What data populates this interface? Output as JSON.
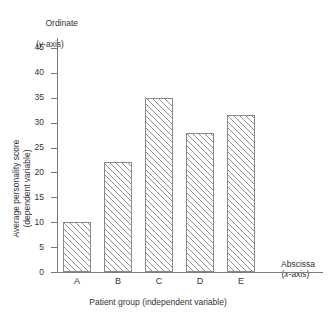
{
  "chart_data": {
    "type": "bar",
    "title": "",
    "categories": [
      "A",
      "B",
      "C",
      "D",
      "E"
    ],
    "values": [
      10,
      22,
      35,
      28,
      31.5
    ],
    "series": [
      {
        "name": "Average personality score",
        "values": [
          10,
          22,
          35,
          28,
          31.5
        ]
      }
    ],
    "xlabel": "Patient group (independent variable)",
    "ylabel": "Average personality score (dependent variable)",
    "ylim": [
      0,
      47
    ],
    "yticks": [
      0,
      5,
      10,
      15,
      20,
      25,
      30,
      35,
      40,
      45
    ],
    "ytick_labels": [
      "0",
      "5",
      "10",
      "15",
      "20",
      "25",
      "30",
      "35",
      "40",
      "45"
    ],
    "grid": false,
    "legend": false,
    "annotations": {
      "ordinate_line1": "Ordinate",
      "ordinate_line2_prefix": "(",
      "ordinate_line2_italic": "y",
      "ordinate_line2_suffix": "-axis)",
      "abscissa_line1": "Abscissa",
      "abscissa_line2_prefix": "(",
      "abscissa_line2_italic": "x",
      "abscissa_line2_suffix": "-axis)"
    },
    "bar_style": {
      "fill": "diagonal-hatch",
      "hatch_color": "#8f8f8f",
      "edge_color": "#8a8a8a",
      "background": "#ffffff"
    },
    "axis_color": "#7a7a7a"
  },
  "y_axis_title": {
    "line1": "Average personality score",
    "line2": "(dependent variable)"
  },
  "x_axis_title": "Patient group (independent variable)",
  "ordinate": {
    "line1": "Ordinate",
    "line2_open": "(",
    "line2_var": "y",
    "line2_close": "-axis)"
  },
  "abscissa": {
    "line1": "Abscissa",
    "line2_open": "(",
    "line2_var": "x",
    "line2_close": "-axis)"
  }
}
